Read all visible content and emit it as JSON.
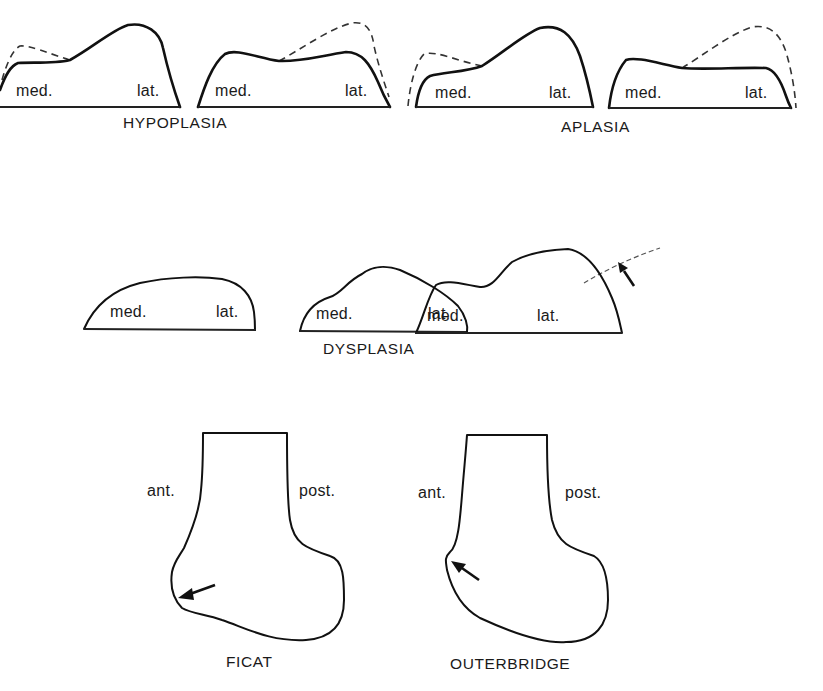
{
  "figure": {
    "sections": [
      {
        "caption": "HYPOPLASIA",
        "shapes": [
          {
            "med_label": "med.",
            "lat_label": "lat."
          },
          {
            "med_label": "med.",
            "lat_label": "lat."
          }
        ]
      },
      {
        "caption": "APLASIA",
        "shapes": [
          {
            "med_label": "med.",
            "lat_label": "lat."
          },
          {
            "med_label": "med.",
            "lat_label": "lat."
          }
        ]
      },
      {
        "caption": "DYSPLASIA",
        "shapes": [
          {
            "med_label": "med.",
            "lat_label": "lat."
          },
          {
            "med_label": "med.",
            "lat_label": "lat."
          },
          {
            "med_label": "med.",
            "lat_label": "lat."
          }
        ]
      },
      {
        "caption": "FICAT",
        "ant_label": "ant.",
        "post_label": "post."
      },
      {
        "caption": "OUTERBRIDGE",
        "ant_label": "ant.",
        "post_label": "post."
      }
    ],
    "legend": {
      "solid_line": "pathologic contour",
      "dashed_line": "normal contour",
      "arrow": "lesion site"
    }
  }
}
